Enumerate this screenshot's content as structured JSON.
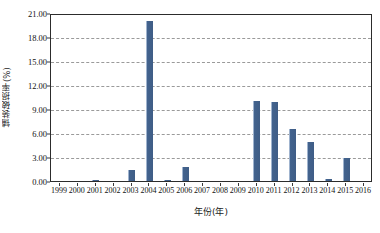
{
  "chart_data": {
    "type": "bar",
    "title": "",
    "xlabel": "年份(年)",
    "ylabel": "铺装破损率(%)",
    "categories": [
      "1999",
      "2000",
      "2001",
      "2002",
      "2003",
      "2004",
      "2005",
      "2006",
      "2007",
      "2008",
      "2009",
      "2010",
      "2011",
      "2012",
      "2013",
      "2014",
      "2015",
      "2016"
    ],
    "values": [
      0.0,
      0.0,
      0.05,
      0.0,
      1.4,
      20.0,
      0.1,
      1.8,
      0.0,
      0.0,
      0.0,
      10.0,
      9.9,
      6.5,
      4.9,
      0.2,
      2.9,
      0.0
    ],
    "ylim": [
      0.0,
      21.0
    ],
    "ytick_step": 3.0,
    "ytick_labels": [
      "0.00",
      "3.00",
      "6.00",
      "9.00",
      "12.00",
      "15.00",
      "18.00",
      "21.00"
    ],
    "grid": true,
    "grid_style": "dashed",
    "legend": null,
    "series_color": "#43638e",
    "axis_color": "#2c2c2c",
    "gridline_color": "#9a9a9a"
  }
}
